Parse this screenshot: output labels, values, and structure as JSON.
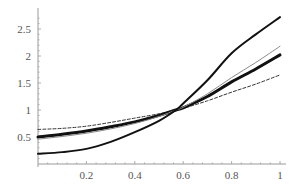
{
  "chart_data": {
    "type": "line",
    "title": "",
    "xlabel": "",
    "ylabel": "",
    "xlim": [
      0,
      1
    ],
    "ylim": [
      0,
      2.7
    ],
    "grid": false,
    "legend": null,
    "x_ticks": [
      0.2,
      0.4,
      0.6,
      0.8,
      1
    ],
    "x_tick_labels": [
      "0.2",
      "0.4",
      "0.6",
      "0.8",
      "1"
    ],
    "y_ticks": [
      0.5,
      1,
      1.5,
      2,
      2.5
    ],
    "y_tick_labels": [
      "0.5",
      "1",
      "1.5",
      "2",
      "2.5"
    ],
    "x": [
      0,
      0.1,
      0.2,
      0.3,
      0.4,
      0.5,
      0.57,
      0.6,
      0.7,
      0.8,
      0.9,
      1.0
    ],
    "series": [
      {
        "name": "dashed",
        "style": "dashed",
        "color": "#333333",
        "width": 1,
        "values": [
          0.64,
          0.66,
          0.7,
          0.77,
          0.85,
          0.93,
          1.0,
          1.03,
          1.17,
          1.33,
          1.48,
          1.65
        ]
      },
      {
        "name": "thick",
        "style": "solid",
        "color": "#111111",
        "width": 3,
        "values": [
          0.5,
          0.55,
          0.61,
          0.69,
          0.78,
          0.9,
          1.0,
          1.04,
          1.25,
          1.52,
          1.76,
          2.02
        ]
      },
      {
        "name": "thin-gray",
        "style": "solid",
        "color": "#8a8a8a",
        "width": 1,
        "values": [
          0.46,
          0.51,
          0.57,
          0.65,
          0.75,
          0.88,
          1.0,
          1.05,
          1.3,
          1.6,
          1.88,
          2.18
        ]
      },
      {
        "name": "steep",
        "style": "solid",
        "color": "#111111",
        "width": 2,
        "values": [
          0.19,
          0.22,
          0.28,
          0.41,
          0.59,
          0.8,
          1.0,
          1.12,
          1.55,
          2.05,
          2.4,
          2.72
        ]
      }
    ]
  },
  "plot": {
    "origin_px": [
      38,
      164
    ],
    "x_scale_px": 242,
    "y_scale_px": 54,
    "x_axis_end_px": 286,
    "y_axis_top_px": 8
  }
}
